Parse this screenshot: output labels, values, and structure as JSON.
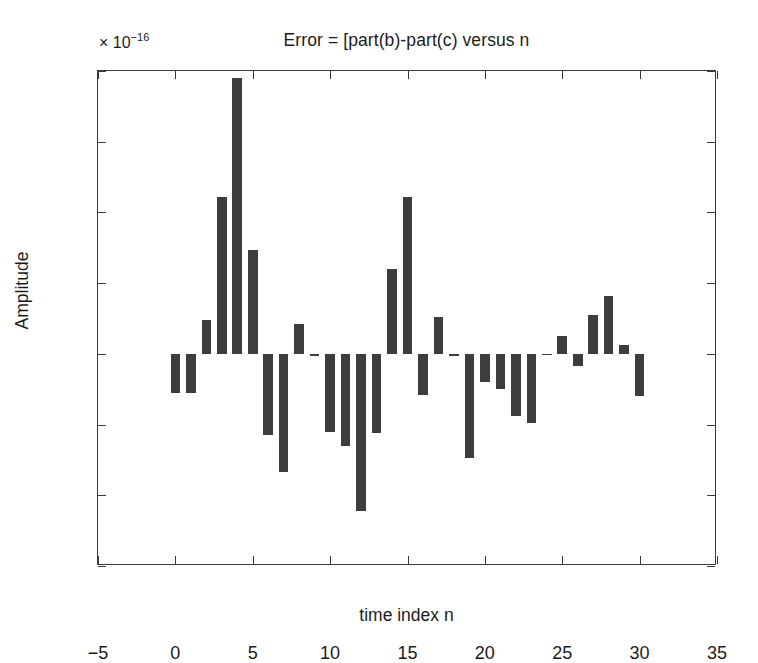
{
  "chart_data": {
    "type": "bar",
    "title": "Error = [part(b)-part(c) versus n",
    "xlabel": "time index n",
    "ylabel": "Amplitude",
    "y_exponent_mantissa": "× 10",
    "y_exponent_power": "−16",
    "y_scale_factor": 1e-16,
    "xlim": [
      -5,
      35
    ],
    "ylim": [
      -6,
      8
    ],
    "xticks": [
      -5,
      0,
      5,
      10,
      15,
      20,
      25,
      30,
      35
    ],
    "xticklabels": [
      "−5",
      "0",
      "5",
      "10",
      "15",
      "20",
      "25",
      "30",
      "35"
    ],
    "yticks": [
      -6,
      -4,
      -2,
      0,
      2,
      4,
      6,
      8
    ],
    "yticklabels": [
      "−6",
      "−4",
      "−2",
      "0",
      "2",
      "4",
      "6",
      "8"
    ],
    "grid": false,
    "legend": null,
    "bar_color": "#3d3d3d",
    "bar_width": 0.62,
    "categories": [
      0,
      1,
      2,
      3,
      4,
      5,
      6,
      7,
      8,
      9,
      10,
      11,
      12,
      13,
      14,
      15,
      16,
      17,
      18,
      19,
      20,
      21,
      22,
      23,
      24,
      25,
      26,
      27,
      28,
      29,
      30
    ],
    "values": [
      -1.1,
      -1.1,
      0.95,
      4.45,
      7.8,
      2.95,
      -2.3,
      -3.35,
      0.85,
      -0.05,
      -2.2,
      -2.6,
      -4.45,
      -2.25,
      2.4,
      4.45,
      -1.15,
      1.05,
      -0.05,
      -2.95,
      -0.8,
      -1.0,
      -1.75,
      -1.95,
      -0.03,
      0.5,
      -0.35,
      1.1,
      1.65,
      0.25,
      -1.2
    ]
  },
  "axes": {
    "frame_color": "#3a3a3a"
  }
}
